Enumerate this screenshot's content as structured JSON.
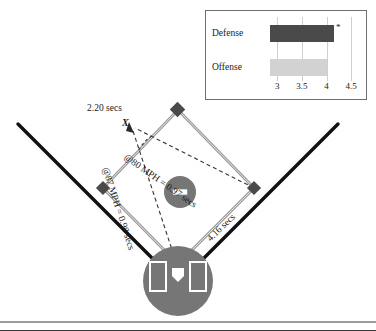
{
  "figure": {
    "type": "baseball-field-diagram",
    "background": "#ffffff",
    "border_color": "#3a3a3a"
  },
  "diagram": {
    "labels": {
      "time_to_x": "2.20 secs",
      "point_x": "X",
      "throw_80": "@80 MPH = 0.97 secs",
      "throw_87": "@87 MPH = 0.98 secs",
      "runner_time": "4.16 secs"
    },
    "elements": {
      "foul_line_left": "foul-line-left",
      "foul_line_right": "foul-line-right",
      "base_second": "second-base",
      "base_third": "third-base",
      "base_first": "first-base",
      "pitchers_mound": "pitchers-mound",
      "pitchers_rubber": "pitchers-rubber",
      "home_plate_circle": "home-plate-circle",
      "batters_box_left": "batters-box-left",
      "batters_box_right": "batters-box-right",
      "home_plate": "home-plate"
    },
    "colors": {
      "foul_line": "#111111",
      "basepath": "#8e8e8e",
      "dashed": "#3b3b3b",
      "dirt": "#777777",
      "base_marker": "#4a4a4a"
    }
  },
  "chart_data": {
    "type": "bar",
    "orientation": "horizontal",
    "title": "",
    "xlabel": "",
    "ylabel": "",
    "categories": [
      "Defense",
      "Offense"
    ],
    "values": [
      4.16,
      4.0
    ],
    "xlim": [
      2.85,
      4.6
    ],
    "ticks": [
      3,
      3.5,
      4,
      4.5
    ],
    "tick_labels": [
      "3",
      "3.5",
      "4",
      "4.5"
    ],
    "grid": true,
    "legend": "none",
    "annotations": [
      {
        "category": "Defense",
        "text": "*",
        "position": "bar-end"
      }
    ],
    "series": [
      {
        "name": "Defense",
        "value": 4.16,
        "color": "#4a4a4a"
      },
      {
        "name": "Offense",
        "value": 4.0,
        "color": "#d2d2d2"
      }
    ]
  },
  "inset": {
    "panel_name": "inset-bar-chart-panel",
    "border_color": "#6f6f6f"
  }
}
